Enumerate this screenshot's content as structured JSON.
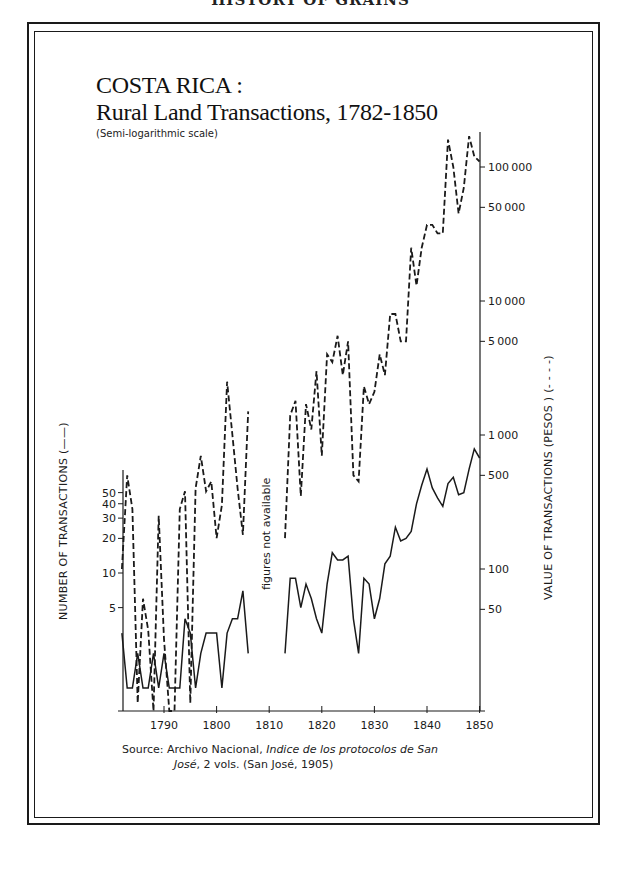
{
  "page": {
    "header_partial": "HISTORY OF GRAINS",
    "title_line1": "COSTA RICA :",
    "title_line2": "Rural Land Transactions, 1782-1850",
    "subtitle": "(Semi-logarithmic scale)",
    "left_axis_label": "NUMBER OF TRANSACTIONS (——)",
    "right_axis_label": "VALUE OF TRANSACTIONS (PESOS ) (- - - -)",
    "gap_note": "figures not available",
    "source_prefix": "Source: Archivo Nacional, ",
    "source_italic": "Indice de los protocolos de San",
    "source_line2_italic": "José",
    "source_line2_rest": ", 2 vols. (San José, 1905)"
  },
  "colors": {
    "ink": "#1a1a1a",
    "background": "#ffffff"
  },
  "chart_data": {
    "type": "line",
    "title": "COSTA RICA : Rural Land Transactions, 1782-1850",
    "subtitle": "(Semi-logarithmic scale)",
    "xlabel": "",
    "x_ticks": [
      1790,
      1800,
      1810,
      1820,
      1830,
      1840,
      1850
    ],
    "xlim": [
      1782,
      1850
    ],
    "y_left": {
      "label": "NUMBER OF TRANSACTIONS (——)",
      "scale": "log",
      "ticks": [
        5,
        10,
        20,
        30,
        40,
        50
      ]
    },
    "y_right": {
      "label": "VALUE OF TRANSACTIONS (PESOS) (- - - -)",
      "scale": "log",
      "ticks": [
        50,
        100,
        500,
        1000,
        5000,
        10000,
        50000,
        100000
      ]
    },
    "annotations": [
      {
        "text": "figures not available",
        "x_range": [
          1807,
          1813
        ]
      }
    ],
    "source": "Source: Archivo Nacional, Indice de los protocolos de San José, 2 vols. (San José, 1905)",
    "series": [
      {
        "name": "Number of transactions",
        "axis": "left",
        "style": "solid",
        "segments": [
          {
            "x": [
              1782,
              1783,
              1784,
              1785,
              1786,
              1787,
              1788,
              1789,
              1790,
              1791,
              1792,
              1793,
              1794,
              1795,
              1796,
              1797,
              1798,
              1799,
              1800,
              1801,
              1802,
              1803,
              1804,
              1805,
              1806
            ],
            "y": [
              3,
              1,
              1,
              2,
              1,
              1,
              2,
              1,
              2,
              1,
              1,
              1,
              4,
              3,
              1,
              2,
              3,
              3,
              3,
              1,
              3,
              4,
              4,
              7,
              2
            ]
          },
          {
            "x": [
              1813,
              1814,
              1815,
              1816,
              1817,
              1818,
              1819,
              1820,
              1821,
              1822,
              1823,
              1824,
              1825,
              1826,
              1827,
              1828,
              1829,
              1830,
              1831,
              1832,
              1833,
              1834,
              1835,
              1836,
              1837,
              1838,
              1839,
              1840,
              1841,
              1842,
              1843,
              1844,
              1845,
              1846,
              1847,
              1848,
              1849,
              1850
            ],
            "y": [
              2,
              9,
              9,
              5,
              8,
              6,
              4,
              3,
              8,
              15,
              13,
              13,
              14,
              4,
              2,
              9,
              8,
              4,
              6,
              12,
              14,
              25,
              19,
              20,
              23,
              40,
              58,
              80,
              55,
              45,
              38,
              60,
              68,
              48,
              50,
              80,
              120,
              100
            ]
          }
        ]
      },
      {
        "name": "Value of transactions (pesos)",
        "axis": "right",
        "style": "dashed",
        "segments": [
          {
            "x": [
              1782,
              1783,
              1784,
              1785,
              1786,
              1787,
              1788,
              1789,
              1790,
              1791,
              1792,
              1793,
              1794,
              1795,
              1796,
              1797,
              1798,
              1799,
              1800,
              1801,
              1802,
              1803,
              1804,
              1805,
              1806
            ],
            "y": [
              100,
              500,
              280,
              10,
              60,
              35,
              5,
              250,
              30,
              5,
              3,
              280,
              380,
              10,
              400,
              700,
              380,
              450,
              170,
              300,
              2500,
              1000,
              400,
              180,
              1500
            ]
          },
          {
            "x": [
              1813,
              1814,
              1815,
              1816,
              1817,
              1818,
              1819,
              1820,
              1821,
              1822,
              1823,
              1824,
              1825,
              1826,
              1827,
              1828,
              1829,
              1830,
              1831,
              1832,
              1833,
              1834,
              1835,
              1836,
              1837,
              1838,
              1839,
              1840,
              1841,
              1842,
              1843,
              1844,
              1845,
              1846,
              1847,
              1848,
              1849,
              1850
            ],
            "y": [
              170,
              1400,
              1800,
              350,
              1700,
              1100,
              3000,
              700,
              4000,
              3500,
              5500,
              2800,
              5000,
              500,
              450,
              2300,
              1700,
              2100,
              4000,
              2800,
              8000,
              8000,
              5000,
              5000,
              25000,
              13000,
              25000,
              37000,
              37000,
              32000,
              32000,
              160000,
              100000,
              45000,
              70000,
              170000,
              120000,
              110000
            ]
          }
        ]
      }
    ]
  }
}
